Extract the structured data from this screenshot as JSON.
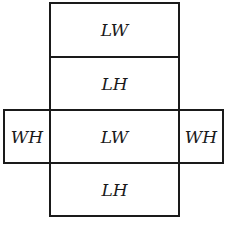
{
  "diagram": {
    "type": "net-of-rectangular-prism",
    "stroke_color": "#1a1a1a",
    "background": "#ffffff",
    "faces": {
      "top": "LW",
      "upper": "LH",
      "center": "LW",
      "bottom": "LH",
      "left": "WH",
      "right": "WH"
    }
  }
}
